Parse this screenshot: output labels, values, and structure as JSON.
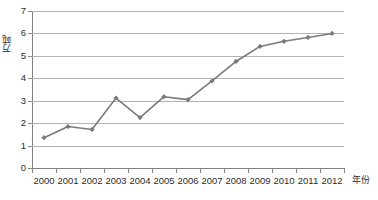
{
  "chart_data": {
    "type": "line",
    "title": "",
    "xlabel": "年份",
    "ylabel": "万吨",
    "categories": [
      "2000",
      "2001",
      "2002",
      "2003",
      "2004",
      "2005",
      "2006",
      "2007",
      "2008",
      "2009",
      "2010",
      "2011",
      "2012"
    ],
    "values": [
      1.35,
      1.85,
      1.72,
      3.12,
      2.25,
      3.18,
      3.05,
      3.88,
      4.75,
      5.42,
      5.65,
      5.82,
      6.0
    ],
    "series": [
      {
        "name": "",
        "values": [
          1.35,
          1.85,
          1.72,
          3.12,
          2.25,
          3.18,
          3.05,
          3.88,
          4.75,
          5.42,
          5.65,
          5.82,
          6.0
        ]
      }
    ],
    "ylim": [
      0,
      7
    ],
    "y_ticks": [
      "0",
      "1",
      "2",
      "3",
      "4",
      "5",
      "6",
      "7"
    ],
    "grid": true,
    "legend": "none",
    "marker": "diamond",
    "series_color": "#7a7a7a",
    "gridline_color": "#b3b3b3",
    "axis_color": "#808080",
    "text_color": "#2b2b2b",
    "background": "#ffffff"
  }
}
